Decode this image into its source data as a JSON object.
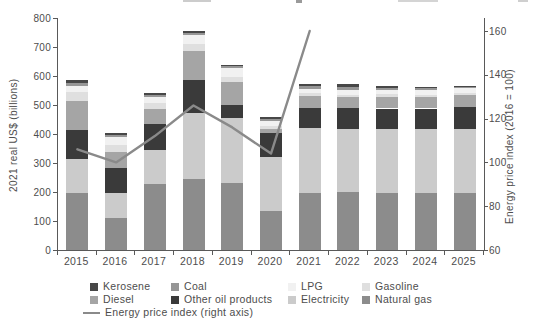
{
  "chart_data": {
    "type": "bar",
    "stacked": true,
    "title": "",
    "categories": [
      "2015",
      "2016",
      "2017",
      "2018",
      "2019",
      "2020",
      "2021",
      "2022",
      "2023",
      "2024",
      "2025"
    ],
    "series": [
      {
        "name": "Natural gas",
        "color": "#8c8c8c",
        "values": [
          195,
          110,
          228,
          245,
          232,
          133,
          198,
          200,
          195,
          195,
          198
        ]
      },
      {
        "name": "Electricity",
        "color": "#cbcbcb",
        "values": [
          118,
          88,
          118,
          228,
          222,
          189,
          222,
          218,
          222,
          222,
          218
        ]
      },
      {
        "name": "Other oil products",
        "color": "#3a3a3a",
        "values": [
          100,
          85,
          88,
          112,
          47,
          81,
          71,
          71,
          71,
          71,
          78
        ]
      },
      {
        "name": "Diesel",
        "color": "#a5a5a5",
        "values": [
          100,
          55,
          53,
          100,
          77,
          15,
          41,
          39,
          41,
          40,
          40
        ]
      },
      {
        "name": "Gasoline",
        "color": "#dfdfdf",
        "values": [
          32,
          25,
          19,
          25,
          18,
          8,
          8,
          8,
          8,
          8,
          8
        ]
      },
      {
        "name": "LPG",
        "color": "#f1f1f1",
        "values": [
          20,
          25,
          20,
          30,
          32,
          20,
          16,
          17,
          15,
          15,
          15
        ]
      },
      {
        "name": "Coal",
        "color": "#969696",
        "values": [
          10,
          7,
          7,
          7,
          5,
          5,
          8,
          8,
          6,
          6,
          5
        ]
      },
      {
        "name": "Kerosene",
        "color": "#474747",
        "values": [
          10,
          7,
          7,
          8,
          6,
          6,
          10,
          10,
          6,
          6,
          5
        ]
      }
    ],
    "line_series": {
      "name": "Energy price index (right axis)",
      "color": "#8a8a8a",
      "values": [
        106,
        100,
        112,
        126,
        116,
        104,
        160,
        null,
        null,
        null,
        null
      ]
    },
    "left_axis": {
      "label": "2021 real US$ (billions)",
      "min": 0,
      "max": 800,
      "ticks": [
        0,
        100,
        200,
        300,
        400,
        500,
        600,
        700,
        800
      ]
    },
    "right_axis": {
      "label": "Energy price index (2016 = 100)",
      "min": 60,
      "max": 160,
      "ticks": [
        60,
        80,
        100,
        120,
        140,
        160
      ]
    },
    "legend": {
      "rows": [
        [
          "Kerosene",
          "Coal",
          "LPG",
          "Gasoline"
        ],
        [
          "Diesel",
          "Other oil products",
          "Electricity",
          "Natural gas"
        ]
      ],
      "line_label": "Energy price index (right axis)"
    }
  }
}
